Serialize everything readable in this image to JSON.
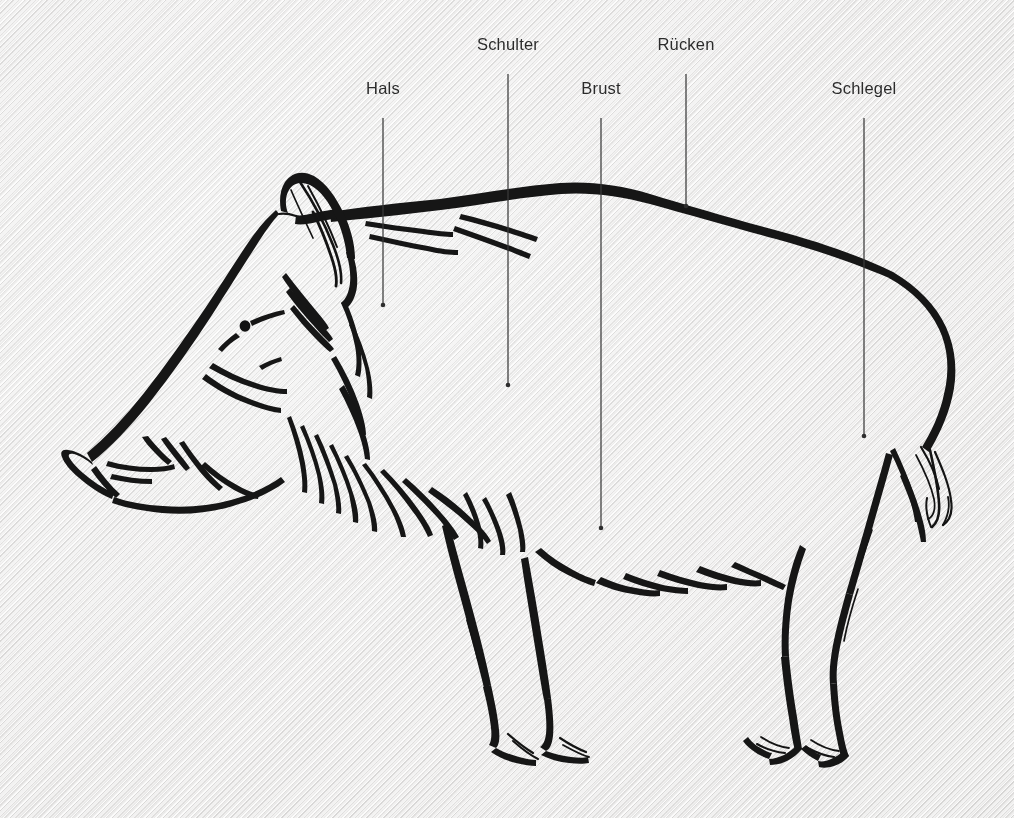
{
  "figure": {
    "style": "ink brush line drawing on textured paper",
    "background_color": "#ecebea",
    "ink_color": "#141414",
    "leader_color": "#3a3a3a",
    "label_color": "#2b2b2b",
    "width": 1014,
    "height": 818
  },
  "labels": [
    {
      "id": "hals",
      "text": "Hals",
      "x": 383,
      "y": 98,
      "line_x": 383,
      "line_top": 118,
      "line_bottom": 305
    },
    {
      "id": "schulter",
      "text": "Schulter",
      "x": 508,
      "y": 54,
      "line_x": 508,
      "line_top": 74,
      "line_bottom": 385
    },
    {
      "id": "brust",
      "text": "Brust",
      "x": 601,
      "y": 98,
      "line_x": 601,
      "line_top": 118,
      "line_bottom": 528
    },
    {
      "id": "ruecken",
      "text": "Rücken",
      "x": 686,
      "y": 54,
      "line_x": 686,
      "line_top": 74,
      "line_bottom": 206
    },
    {
      "id": "schlegel",
      "text": "Schlegel",
      "x": 864,
      "y": 98,
      "line_x": 864,
      "line_top": 118,
      "line_bottom": 436
    }
  ]
}
